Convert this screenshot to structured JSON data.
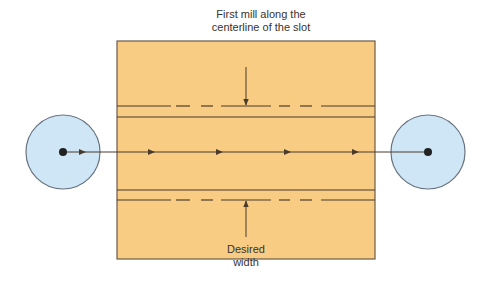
{
  "diagram": {
    "labels": {
      "top_line1": "First mill along the",
      "top_line2": "centerline of the slot",
      "bottom_line1": "Desired",
      "bottom_line2": "width"
    },
    "colors": {
      "workpiece_fill": "#f9cc84",
      "workpiece_stroke": "#6b5a48",
      "line": "#4a3b2c",
      "cutter_fill": "#cfe6f7",
      "cutter_stroke": "#6a7480",
      "dot": "#222222",
      "background": "#ffffff"
    },
    "workpiece": {
      "x": 117,
      "y": 41,
      "width": 258,
      "height": 218
    },
    "slot_lines": {
      "top_dashed_y": 106,
      "top_solid_y": 117,
      "bottom_solid_y": 190,
      "bottom_dashed_y": 200
    },
    "dash_segments": [
      [
        117,
        171
      ],
      [
        176,
        190
      ],
      [
        201,
        213
      ],
      [
        221,
        271
      ],
      [
        279,
        290
      ],
      [
        300,
        312
      ],
      [
        321,
        375
      ]
    ],
    "cutter_path": {
      "y": 152,
      "x_start": 63,
      "x_end": 428,
      "arrow_x": [
        83,
        152,
        220,
        288,
        356
      ]
    },
    "cutters": [
      {
        "name": "start",
        "cx": 63,
        "cy": 152,
        "r": 37
      },
      {
        "name": "end",
        "cx": 428,
        "cy": 152,
        "r": 37
      }
    ],
    "width_arrows": {
      "x": 246,
      "down": {
        "y1": 67,
        "y2": 105
      },
      "up": {
        "y1": 237,
        "y2": 201
      }
    }
  }
}
